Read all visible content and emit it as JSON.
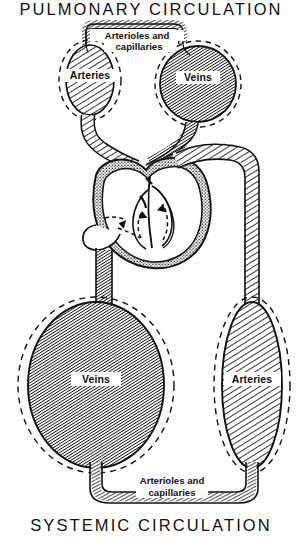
{
  "diagram": {
    "kind": "circulatory-system-schematic",
    "title_top": "PULMONARY  CIRCULATION",
    "title_bottom": "SYSTEMIC  CIRCULATION",
    "background_color": "#ffffff",
    "ink_color": "#111111"
  },
  "pulmonary": {
    "capillary_label_line1": "Arterioles  and",
    "capillary_label_line2": "capillaries",
    "arteries_label": "Arteries",
    "veins_label": "Veins"
  },
  "systemic": {
    "capillary_label_line1": "Arterioles  and",
    "capillary_label_line2": "capillaries",
    "arteries_label": "Arteries",
    "veins_label": "Veins"
  },
  "legend": {
    "dark_fill_means": "Veins",
    "light_hatch_means": "Arteries",
    "stipple_means": "capillary bed / heart wall",
    "dashed_outline_means": "vessel capacity envelope"
  },
  "heart": {
    "present": true,
    "flow_arrows": 4,
    "wall_texture": "stipple"
  }
}
